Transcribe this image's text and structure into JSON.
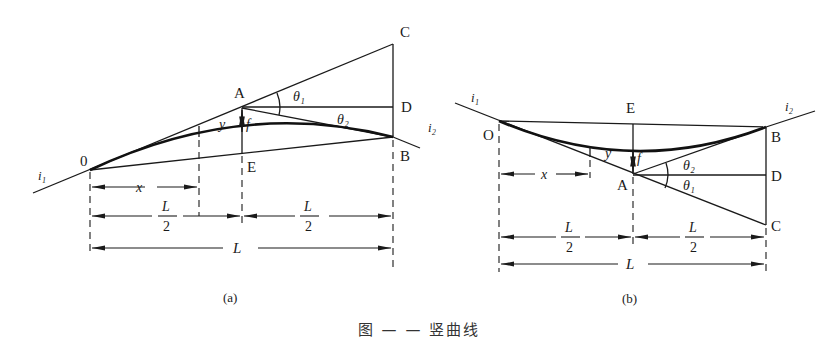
{
  "figure": {
    "caption": "图 — — 竖曲线",
    "panels": [
      {
        "id": "a",
        "label": "(a)",
        "type": "convex vertical curve",
        "points": {
          "O": "0",
          "A": "A",
          "B": "B",
          "C": "C",
          "D": "D",
          "E": "E"
        },
        "grades": {
          "i1": "i₁",
          "i2": "i₂"
        },
        "angles": {
          "theta1": "θ₁",
          "theta2": "θ₂"
        },
        "offsets": {
          "y": "y",
          "f": "f"
        },
        "dimensions": {
          "x": "x",
          "half_left": "L/2",
          "half_right": "L/2",
          "total": "L"
        }
      },
      {
        "id": "b",
        "label": "(b)",
        "type": "concave vertical curve",
        "points": {
          "O": "O",
          "A": "A",
          "B": "B",
          "C": "C",
          "D": "D",
          "E": "E"
        },
        "grades": {
          "i1": "i₁",
          "i2": "i₂"
        },
        "angles": {
          "theta1": "θ₁",
          "theta2": "θ₂"
        },
        "offsets": {
          "y": "y",
          "f": "f"
        },
        "dimensions": {
          "x": "x",
          "half_left": "L/2",
          "half_right": "L/2",
          "total": "L"
        }
      }
    ],
    "fraction": {
      "numerator": "L",
      "denominator": "2"
    }
  }
}
